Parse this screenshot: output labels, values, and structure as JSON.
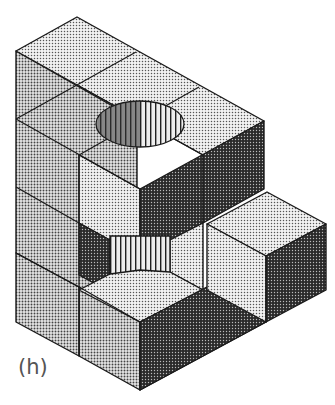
{
  "figure": {
    "label": "(h)",
    "colors": {
      "light_face": "#d6d6d6",
      "mid_face": "#bdbdbd",
      "dark_face": "#3a3a3a",
      "edge": "#1a1a1a",
      "hole_stripes": "#222222"
    }
  }
}
